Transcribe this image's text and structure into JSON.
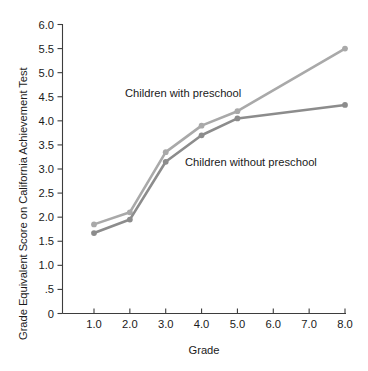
{
  "chart_data": {
    "type": "line",
    "title": "",
    "xlabel": "Grade",
    "ylabel": "Grade Equivalent Score on California Achievement Test",
    "categories": [
      "1.0",
      "2.0",
      "3.0",
      "4.0",
      "5.0",
      "6.0",
      "7.0",
      "8.0"
    ],
    "x_tick_labels": [
      "1.0",
      "2.0",
      "3.0",
      "4.0",
      "5.0",
      "6.0",
      "7.0",
      "8.0"
    ],
    "y_tick_labels": [
      "0",
      ".5",
      "1.0",
      "1.5",
      "2.0",
      "2.5",
      "3.0",
      "3.5",
      "4.0",
      "4.5",
      "5.0",
      "5.5",
      "6.0"
    ],
    "y_tick_values": [
      0,
      0.5,
      1.0,
      1.5,
      2.0,
      2.5,
      3.0,
      3.5,
      4.0,
      4.5,
      5.0,
      5.5,
      6.0
    ],
    "ylim": [
      0,
      6.0
    ],
    "xlim_categories": 8,
    "grid": false,
    "legend_position": "inline-annotation",
    "series": [
      {
        "name": "Children with preschool",
        "color": "#a9a9a9",
        "marker": "circle",
        "x": [
          "1.0",
          "2.0",
          "3.0",
          "4.0",
          "5.0",
          "8.0"
        ],
        "values": [
          1.85,
          2.1,
          3.35,
          3.9,
          4.2,
          5.5
        ],
        "annotation": "Children with preschool"
      },
      {
        "name": "Children without preschool",
        "color": "#8c8c8c",
        "marker": "circle",
        "x": [
          "1.0",
          "2.0",
          "3.0",
          "4.0",
          "5.0",
          "8.0"
        ],
        "values": [
          1.67,
          1.95,
          3.15,
          3.7,
          4.05,
          4.33
        ],
        "annotation": "Children without preschool"
      }
    ],
    "annotations": [
      {
        "text": "Children with preschool",
        "x_px": 125,
        "y_px": 97
      },
      {
        "text": "Children without preschool",
        "x_px": 185,
        "y_px": 166
      }
    ]
  },
  "colors": {
    "axis": "#3d3d3d",
    "text": "#1a1a1a",
    "background": "#ffffff",
    "series_with_preschool": "#a9a9a9",
    "series_without_preschool": "#8c8c8c"
  }
}
